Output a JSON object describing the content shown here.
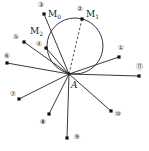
{
  "diagram": {
    "center": {
      "label": "A",
      "x": 69,
      "y": 74
    },
    "circle": {
      "cx": 75,
      "cy": 46,
      "r": 28
    },
    "dashed_line": {
      "from": "A",
      "to": "M1"
    },
    "points": [
      {
        "id": "1",
        "label": "①",
        "x": 119,
        "y": 57,
        "lx": 121,
        "ly": 48
      },
      {
        "id": "2",
        "label": "②",
        "x": 82,
        "y": 19,
        "lx": 80,
        "ly": 9,
        "tag": "M",
        "sub": "1",
        "tx": 86,
        "ty": 17
      },
      {
        "id": "3",
        "label": "③",
        "x": 44,
        "y": 14,
        "lx": 41,
        "ly": 5,
        "tag": "M",
        "sub": "0",
        "tx": 48,
        "ty": 17
      },
      {
        "id": "4",
        "label": "④",
        "x": 46,
        "y": 48,
        "lx": 39,
        "ly": 44,
        "tag": "M",
        "sub": "2",
        "tx": 30,
        "ty": 34
      },
      {
        "id": "5",
        "label": "⑤",
        "x": 24,
        "y": 42,
        "lx": 16,
        "ly": 37
      },
      {
        "id": "6",
        "label": "⑥",
        "x": 7,
        "y": 63,
        "lx": 7,
        "ly": 56
      },
      {
        "id": "7",
        "label": "⑦",
        "x": 19,
        "y": 99,
        "lx": 13,
        "ly": 94
      },
      {
        "id": "8",
        "label": "⑧",
        "x": 49,
        "y": 114,
        "lx": 43,
        "ly": 122
      },
      {
        "id": "9",
        "label": "⑨",
        "x": 67,
        "y": 138,
        "lx": 77,
        "ly": 137
      },
      {
        "id": "10",
        "label": "⑩",
        "x": 111,
        "y": 111,
        "lx": 118,
        "ly": 114
      },
      {
        "id": "11",
        "label": "⑪",
        "x": 139,
        "y": 76,
        "lx": 139,
        "ly": 67
      }
    ],
    "colors": {
      "stroke": "#222222",
      "background": "#ffffff"
    }
  }
}
